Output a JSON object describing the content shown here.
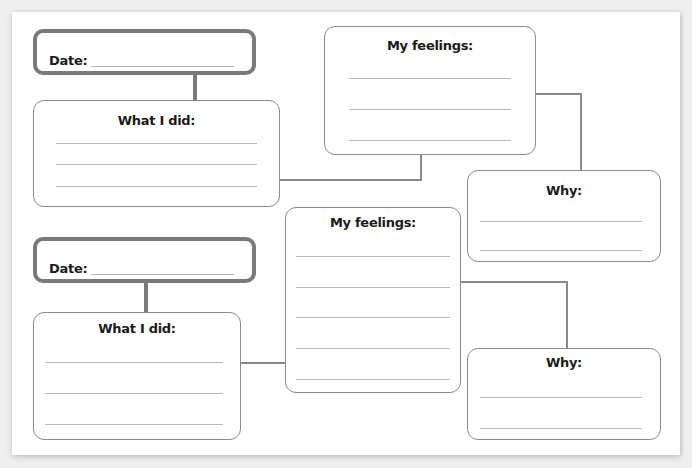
{
  "worksheet": {
    "set1": {
      "date": {
        "label": "Date:",
        "value": ""
      },
      "what_i_did": {
        "title": "What I did:",
        "lines": [
          "",
          "",
          ""
        ]
      },
      "my_feelings": {
        "title": "My feelings:",
        "lines": [
          "",
          "",
          ""
        ]
      },
      "why": {
        "title": "Why:",
        "lines": [
          "",
          ""
        ]
      }
    },
    "set2": {
      "date": {
        "label": "Date:",
        "value": ""
      },
      "what_i_did": {
        "title": "What I did:",
        "lines": [
          "",
          "",
          ""
        ]
      },
      "my_feelings": {
        "title": "My feelings:",
        "lines": [
          "",
          "",
          "",
          "",
          ""
        ]
      },
      "why": {
        "title": "Why:",
        "lines": [
          "",
          ""
        ]
      }
    }
  },
  "colors": {
    "page": "#ffffff",
    "background": "#efefef",
    "box_border": "#8a8a8a",
    "date_border": "#7a7a7a",
    "rule": "#b8b8b8",
    "text": "#1a1a1a"
  }
}
